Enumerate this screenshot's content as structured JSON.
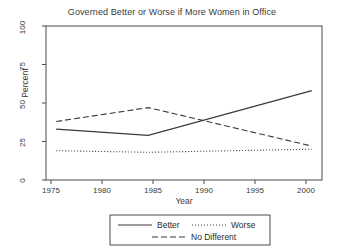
{
  "chart_data": {
    "type": "line",
    "title": "Governed Better or Worse if More Women in Office",
    "xlabel": "Year",
    "ylabel": "Percent",
    "xlim": [
      1974,
      2001
    ],
    "ylim": [
      0,
      100
    ],
    "xticks": [
      1975,
      1980,
      1985,
      1990,
      1995,
      2000
    ],
    "yticks": [
      0,
      25,
      50,
      75,
      100
    ],
    "grid": false,
    "legend_position": "below-axes",
    "series": [
      {
        "name": "Better",
        "style": "solid",
        "color": "#3a3a3a",
        "x": [
          1975,
          1984,
          2000
        ],
        "values": [
          33,
          29,
          58
        ]
      },
      {
        "name": "Worse",
        "style": "dotted",
        "color": "#3a3a3a",
        "x": [
          1975,
          1984,
          2000
        ],
        "values": [
          19,
          18,
          20
        ]
      },
      {
        "name": "No Different",
        "style": "dashed",
        "color": "#3a3a3a",
        "x": [
          1975,
          1984,
          2000
        ],
        "values": [
          38,
          47,
          22
        ]
      }
    ]
  },
  "axes": {
    "ytick_labels": [
      "0",
      "25",
      "50",
      "75",
      "100"
    ],
    "xtick_labels": [
      "1975",
      "1980",
      "1985",
      "1990",
      "1995",
      "2000"
    ],
    "ylabel": "Percent",
    "xlabel": "Year"
  },
  "title": "Governed Better or Worse if More Women in Office",
  "legend": {
    "items": [
      {
        "label": "Better",
        "style": "solid"
      },
      {
        "label": "Worse",
        "style": "dotted"
      },
      {
        "label": "No Different",
        "style": "dashed"
      }
    ]
  }
}
